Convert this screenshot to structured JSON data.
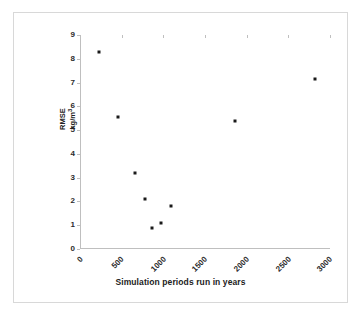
{
  "chart_data": {
    "type": "scatter",
    "title": "",
    "xlabel": "Simulation periods run in years",
    "ylabel": "RMSE kg/m³",
    "ylabel_line1": "RMSE",
    "ylabel_line2": "kg/m",
    "ylabel_line2_sup": "3",
    "xlim": [
      0,
      3000
    ],
    "ylim": [
      0,
      9
    ],
    "xticks": [
      0,
      500,
      1000,
      1500,
      2000,
      2500,
      3000
    ],
    "xtick_labels": [
      "0",
      "500",
      "1000",
      "1500",
      "2000",
      "2500",
      "3000"
    ],
    "yticks": [
      0,
      1,
      2,
      3,
      4,
      5,
      6,
      7,
      8,
      9
    ],
    "ytick_labels": [
      "0",
      "1",
      "2",
      "3",
      "4",
      "5",
      "6",
      "7",
      "8",
      "9"
    ],
    "grid": false,
    "legend": false,
    "marker": "square",
    "marker_color": "#1a1a1a",
    "points": [
      {
        "x": 224,
        "y": 8.3
      },
      {
        "x": 460,
        "y": 5.55
      },
      {
        "x": 658,
        "y": 3.2
      },
      {
        "x": 776,
        "y": 2.1
      },
      {
        "x": 868,
        "y": 0.9
      },
      {
        "x": 974,
        "y": 1.1
      },
      {
        "x": 1092,
        "y": 1.8
      },
      {
        "x": 1855,
        "y": 5.4
      },
      {
        "x": 2816,
        "y": 7.15
      }
    ]
  },
  "figure": {
    "border_color": "#d8d8d8",
    "background": "#ffffff",
    "axis_color": "#bfbfbf"
  }
}
